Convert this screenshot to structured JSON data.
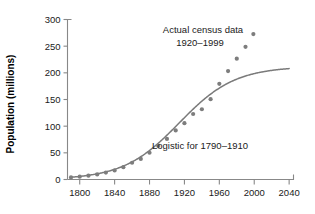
{
  "chart_data": {
    "type": "scatter",
    "title": "",
    "xlabel": "",
    "ylabel": "Population (millions)",
    "xlim": [
      1786,
      2045
    ],
    "ylim": [
      0,
      300
    ],
    "xticks": [
      1800,
      1840,
      1880,
      1920,
      1960,
      2000,
      2040
    ],
    "yticks": [
      0,
      50,
      100,
      150,
      200,
      250,
      300
    ],
    "xtick_labels": [
      "1800",
      "1840",
      "1880",
      "1920",
      "1960",
      "2000",
      "2040"
    ],
    "ytick_labels": [
      "0",
      "50",
      "100",
      "150",
      "200",
      "250",
      "300"
    ],
    "grid": false,
    "legend": "none",
    "series": [
      {
        "name": "Actual census data",
        "type": "scatter",
        "marker": "filled-circle",
        "color": "#7d7d7d",
        "x": [
          1790,
          1800,
          1810,
          1820,
          1830,
          1840,
          1850,
          1860,
          1870,
          1880,
          1890,
          1900,
          1910,
          1920,
          1930,
          1940,
          1950,
          1960,
          1970,
          1980,
          1990,
          1999
        ],
        "y": [
          3.9,
          5.3,
          7.2,
          9.6,
          12.9,
          17.1,
          23.2,
          31.4,
          38.6,
          50.2,
          62.9,
          76.0,
          92.0,
          105.7,
          122.8,
          131.7,
          150.7,
          179.3,
          203.3,
          226.5,
          248.7,
          272.7
        ]
      },
      {
        "name": "Logistic for 1790-1910",
        "type": "line",
        "color": "#7a7a7a",
        "model": "logistic",
        "L": 212.0,
        "k": 0.0313,
        "x0": 1914.0,
        "x_range": [
          1790,
          2040
        ]
      }
    ],
    "annotations": [
      {
        "name": "census-annotation",
        "line1": "Actual census data",
        "line2": "1920–1999",
        "x": 1925,
        "y": 278
      },
      {
        "name": "logistic-annotation",
        "line1": "Logistic for 1790–1910",
        "x": 1913,
        "y": 60
      }
    ],
    "colors": {
      "dots": "#7d7d7d",
      "curve": "#7a7a7a",
      "axis": "#888888",
      "text": "#1a1a1a",
      "background": "#ffffff"
    }
  }
}
